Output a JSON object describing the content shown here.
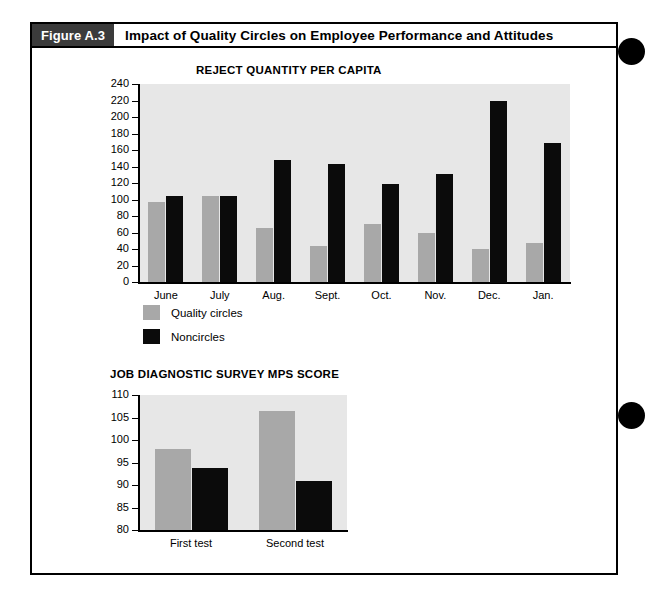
{
  "figure": {
    "tag": "Figure A.3",
    "title": "Impact of Quality Circles on Employee Performance and Attitudes"
  },
  "legend": {
    "items": [
      {
        "label": "Quality circles",
        "color": "#a8a8a8",
        "key": "quality_circles"
      },
      {
        "label": "Noncircles",
        "color": "#0b0b0b",
        "key": "noncircles"
      }
    ]
  },
  "chart_data": [
    {
      "id": "reject-quantity-chart",
      "type": "bar",
      "title": "REJECT QUANTITY PER CAPITA",
      "xlabel": "",
      "ylabel": "",
      "ylim": [
        0,
        240
      ],
      "ytick_step": 20,
      "yticks": [
        0,
        20,
        40,
        60,
        80,
        100,
        120,
        140,
        160,
        180,
        200,
        220,
        240
      ],
      "grid": false,
      "legend_position": "below-left",
      "categories": [
        "June",
        "July",
        "Aug.",
        "Sept.",
        "Oct.",
        "Nov.",
        "Dec.",
        "Jan."
      ],
      "series": [
        {
          "name": "Quality circles",
          "color": "#a8a8a8",
          "values": [
            97,
            104,
            66,
            44,
            70,
            59,
            40,
            47
          ]
        },
        {
          "name": "Noncircles",
          "color": "#0b0b0b",
          "values": [
            104,
            104,
            148,
            143,
            119,
            131,
            220,
            168
          ]
        }
      ]
    },
    {
      "id": "mps-score-chart",
      "type": "bar",
      "title": "JOB DIAGNOSTIC SURVEY MPS SCORE",
      "xlabel": "",
      "ylabel": "",
      "ylim": [
        80,
        110
      ],
      "ytick_step": 5,
      "yticks": [
        80,
        85,
        90,
        95,
        100,
        105,
        110
      ],
      "grid": false,
      "legend_position": "shared-above",
      "categories": [
        "First test",
        "Second test"
      ],
      "series": [
        {
          "name": "Quality circles",
          "color": "#a8a8a8",
          "values": [
            98,
            106.4
          ]
        },
        {
          "name": "Noncircles",
          "color": "#0b0b0b",
          "values": [
            93.8,
            90.8
          ]
        }
      ]
    }
  ],
  "decorations": {
    "binding_dots": [
      {
        "name": "binding-dot-top"
      },
      {
        "name": "binding-dot-bottom"
      }
    ]
  }
}
